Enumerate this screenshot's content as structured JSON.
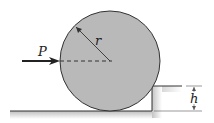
{
  "labels": {
    "force": "P",
    "radius": "r",
    "height": "h"
  },
  "colors": {
    "disk": "#b9b9b9",
    "stroke": "#333333",
    "ground": "#c8c8c8"
  }
}
